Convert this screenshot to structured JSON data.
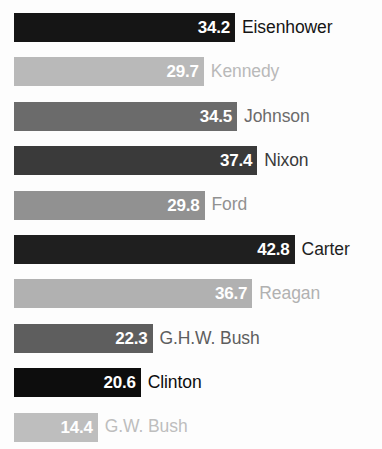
{
  "chart_data": {
    "type": "bar",
    "title": "",
    "subtitle": "",
    "xlabel": "",
    "ylabel": "",
    "orientation": "horizontal",
    "grid": false,
    "legend": false,
    "xlim": [
      0,
      45
    ],
    "categories": [
      "Eisenhower",
      "Kennedy",
      "Johnson",
      "Nixon",
      "Ford",
      "Carter",
      "Reagan",
      "G.H.W. Bush",
      "Clinton",
      "G.W. Bush"
    ],
    "values": [
      34.2,
      29.7,
      34.5,
      37.4,
      29.8,
      42.8,
      36.7,
      22.3,
      20.6,
      14.4
    ],
    "value_labels": [
      "34.2",
      "29.7",
      "34.5",
      "37.4",
      "29.8",
      "42.8",
      "36.7",
      "22.3",
      "20.6",
      "14.4"
    ],
    "bar_colors": [
      "#151515",
      "#b9b9b9",
      "#6b6b6b",
      "#3a3a3a",
      "#919191",
      "#1f1f1f",
      "#b1b1b1",
      "#5e5e5e",
      "#0d0d0d",
      "#bebebe"
    ],
    "label_colors": [
      "#151515",
      "#b9b9b9",
      "#6b6b6b",
      "#3a3a3a",
      "#919191",
      "#1f1f1f",
      "#b1b1b1",
      "#5e5e5e",
      "#0d0d0d",
      "#bebebe"
    ],
    "bars": [
      {
        "name": "Eisenhower",
        "value": 34.2,
        "value_label": "34.2",
        "color": "#151515"
      },
      {
        "name": "Kennedy",
        "value": 29.7,
        "value_label": "29.7",
        "color": "#b9b9b9"
      },
      {
        "name": "Johnson",
        "value": 34.5,
        "value_label": "34.5",
        "color": "#6b6b6b"
      },
      {
        "name": "Nixon",
        "value": 37.4,
        "value_label": "37.4",
        "color": "#3a3a3a"
      },
      {
        "name": "Ford",
        "value": 29.8,
        "value_label": "29.8",
        "color": "#919191"
      },
      {
        "name": "Carter",
        "value": 42.8,
        "value_label": "42.8",
        "color": "#1f1f1f"
      },
      {
        "name": "Reagan",
        "value": 36.7,
        "value_label": "36.7",
        "color": "#b1b1b1"
      },
      {
        "name": "G.H.W. Bush",
        "value": 22.3,
        "value_label": "22.3",
        "color": "#5e5e5e"
      },
      {
        "name": "Clinton",
        "value": 20.6,
        "value_label": "20.6",
        "color": "#0d0d0d"
      },
      {
        "name": "G.W. Bush",
        "value": 14.4,
        "value_label": "14.4",
        "color": "#bebebe"
      }
    ]
  },
  "layout": {
    "bar_origin_x": 14,
    "px_per_unit": 6.93,
    "zero_offset_px": -16,
    "first_bar_top": 13,
    "row_pitch": 44.4,
    "bar_height": 29
  }
}
